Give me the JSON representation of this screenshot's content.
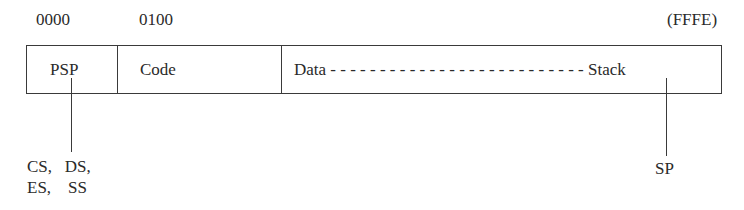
{
  "diagram": {
    "addresses": {
      "start": "0000",
      "code_start": "0100",
      "end": "(FFFE)"
    },
    "segments": [
      {
        "label": "PSP"
      },
      {
        "label": "Code"
      },
      {
        "label": "Data - - - - - - - - - - - - - - - - - - - - - - - - - - Stack"
      }
    ],
    "pointers": {
      "psp_registers_line1": "CS,   DS,",
      "psp_registers_line2": "ES,    SS",
      "stack_pointer": "SP"
    },
    "colors": {
      "line": "#3a3a3a",
      "text": "#2a2a2a",
      "background": "#ffffff"
    }
  }
}
